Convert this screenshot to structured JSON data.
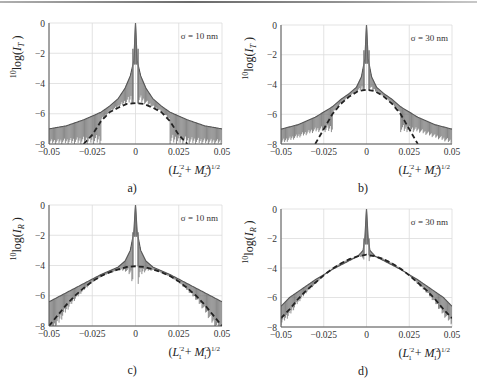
{
  "figure": {
    "top_rule_color": "#888888",
    "grid_color": "#dcdcdc",
    "axis_color": "#555555",
    "curve_color": "#555555",
    "dashed_color": "#222222"
  },
  "chart_data": [
    {
      "id": "a",
      "type": "line",
      "panel_label": "a)",
      "annotation": "σ = 10 nm",
      "ylabel": "10log(I_T)",
      "ylabel_parts": {
        "pre": "10",
        "main": "log(",
        "var": "I",
        "sub": "T",
        "post": " )"
      },
      "xlabel": "(L2'^2 + M2'^2)^1/2",
      "xlabel_parts": {
        "var1": "L",
        "sub1": "2",
        "sup1": "′2",
        "var2": "M",
        "sub2": "2",
        "sup2": "′2",
        "pow": "1/2"
      },
      "xlim": [
        -0.05,
        0.05
      ],
      "ylim": [
        -8,
        0
      ],
      "xticks": [
        "-0.05",
        "-0.025",
        "0",
        "0.025",
        "0.05"
      ],
      "yticks": [
        "0",
        "-2",
        "-4",
        "-6",
        "-8"
      ],
      "grid": true,
      "frame": {
        "x0": 49,
        "y0": 23,
        "x1": 222,
        "y1": 144
      },
      "series": [
        {
          "name": "envelope (oscillating, solid)",
          "x": [
            -0.05,
            -0.04,
            -0.03,
            -0.02,
            -0.015,
            -0.01,
            -0.006,
            -0.003,
            -0.001,
            0,
            0.001,
            0.003,
            0.006,
            0.01,
            0.015,
            0.02,
            0.03,
            0.04,
            0.05
          ],
          "values": [
            -7.0,
            -6.8,
            -6.4,
            -5.9,
            -5.5,
            -5.0,
            -4.3,
            -3.5,
            -2.5,
            0,
            -2.5,
            -3.5,
            -4.3,
            -5.0,
            -5.5,
            -5.9,
            -6.4,
            -6.8,
            -7.0
          ]
        },
        {
          "name": "oscillation floor",
          "x": [
            -0.05,
            0.05
          ],
          "values": [
            -8,
            -8
          ]
        },
        {
          "name": "mean (dashed)",
          "x": [
            -0.03,
            -0.025,
            -0.02,
            -0.015,
            -0.01,
            -0.005,
            0,
            0.005,
            0.01,
            0.015,
            0.02,
            0.025,
            0.03
          ],
          "values": [
            -8.0,
            -7.4,
            -6.5,
            -5.9,
            -5.6,
            -5.35,
            -5.3,
            -5.35,
            -5.6,
            -5.9,
            -6.5,
            -7.4,
            -8.0
          ]
        }
      ],
      "central_peak": {
        "x": 0,
        "y": 0,
        "side_peaks_y": -1.7
      }
    },
    {
      "id": "b",
      "type": "line",
      "panel_label": "b)",
      "annotation": "σ = 30 nm",
      "ylabel": "10log(I_T)",
      "ylabel_parts": {
        "pre": "10",
        "main": "log(",
        "var": "I",
        "sub": "T",
        "post": " )"
      },
      "xlabel": "(L2'^2 + M2'^2)^1/2",
      "xlabel_parts": {
        "var1": "L",
        "sub1": "2",
        "sup1": "′2",
        "var2": "M",
        "sub2": "2",
        "sup2": "′2",
        "pow": "1/2"
      },
      "xlim": [
        -0.05,
        0.05
      ],
      "ylim": [
        -8,
        0
      ],
      "xticks": [
        "-0.05",
        "-0.025",
        "0",
        "0.025",
        "0.05"
      ],
      "yticks": [
        "0",
        "-2",
        "-4",
        "-6",
        "-8"
      ],
      "grid": true,
      "frame": {
        "x0": 281,
        "y0": 25,
        "x1": 452,
        "y1": 144
      },
      "series": [
        {
          "name": "envelope (oscillating, solid)",
          "x": [
            -0.05,
            -0.04,
            -0.03,
            -0.02,
            -0.015,
            -0.01,
            -0.006,
            -0.003,
            -0.001,
            0,
            0.001,
            0.003,
            0.006,
            0.01,
            0.015,
            0.02,
            0.03,
            0.04,
            0.05
          ],
          "values": [
            -7.0,
            -6.7,
            -6.2,
            -5.5,
            -5.0,
            -4.6,
            -4.2,
            -3.5,
            -2.3,
            0,
            -2.3,
            -3.5,
            -4.2,
            -4.6,
            -5.0,
            -5.5,
            -6.2,
            -6.7,
            -7.0
          ]
        },
        {
          "name": "oscillation floor",
          "x": [
            -0.05,
            -0.03,
            0.03,
            0.05
          ],
          "values": [
            -8,
            -7.2,
            -7.2,
            -8
          ]
        },
        {
          "name": "mean (dashed)",
          "x": [
            -0.03,
            -0.025,
            -0.02,
            -0.015,
            -0.01,
            -0.005,
            0,
            0.005,
            0.01,
            0.015,
            0.02,
            0.025,
            0.03
          ],
          "values": [
            -8.0,
            -7.0,
            -6.0,
            -5.3,
            -4.8,
            -4.45,
            -4.35,
            -4.45,
            -4.8,
            -5.3,
            -6.0,
            -7.0,
            -8.0
          ]
        }
      ],
      "central_peak": {
        "x": 0,
        "y": 0,
        "side_peaks_y": -1.7
      }
    },
    {
      "id": "c",
      "type": "line",
      "panel_label": "c)",
      "annotation": "σ = 10 nm",
      "ylabel": "10log(I_R)",
      "ylabel_parts": {
        "pre": "10",
        "main": "log(",
        "var": "I",
        "sub": "R",
        "post": " )"
      },
      "xlabel": "(L1'^2 + M1'^2)^1/2",
      "xlabel_parts": {
        "var1": "L",
        "sub1": "1",
        "sup1": "′2",
        "var2": "M",
        "sub2": "1",
        "sup2": "′2",
        "pow": "1/2"
      },
      "xlim": [
        -0.05,
        0.05
      ],
      "ylim": [
        -8,
        0
      ],
      "xticks": [
        "-0.05",
        "-0.025",
        "0",
        "0.025",
        "0.05"
      ],
      "yticks": [
        "0",
        "-2",
        "-4",
        "-6",
        "-8"
      ],
      "grid": true,
      "frame": {
        "x0": 49,
        "y0": 205,
        "x1": 222,
        "y1": 326
      },
      "series": [
        {
          "name": "envelope (oscillating, solid)",
          "x": [
            -0.05,
            -0.04,
            -0.03,
            -0.02,
            -0.01,
            -0.006,
            -0.003,
            -0.001,
            0,
            0.001,
            0.003,
            0.006,
            0.01,
            0.02,
            0.03,
            0.04,
            0.05
          ],
          "values": [
            -6.4,
            -5.8,
            -5.2,
            -4.6,
            -4.1,
            -3.7,
            -3.0,
            -1.8,
            0,
            -1.8,
            -3.0,
            -3.7,
            -4.1,
            -4.6,
            -5.2,
            -5.8,
            -6.4
          ]
        },
        {
          "name": "mean (dashed)",
          "x": [
            -0.05,
            -0.045,
            -0.04,
            -0.035,
            -0.03,
            -0.025,
            -0.02,
            -0.015,
            -0.01,
            -0.005,
            0,
            0.005,
            0.01,
            0.015,
            0.02,
            0.025,
            0.03,
            0.035,
            0.04,
            0.045,
            0.05
          ],
          "values": [
            -8.0,
            -7.3,
            -6.6,
            -6.0,
            -5.5,
            -5.05,
            -4.7,
            -4.45,
            -4.25,
            -4.1,
            -4.05,
            -4.1,
            -4.25,
            -4.45,
            -4.7,
            -5.05,
            -5.5,
            -6.0,
            -6.6,
            -7.3,
            -8.0
          ]
        }
      ],
      "central_peak": {
        "x": 0,
        "y": 0,
        "side_peaks_y": -1.8
      }
    },
    {
      "id": "d",
      "type": "line",
      "panel_label": "d)",
      "annotation": "σ = 30 nm",
      "ylabel": "10log(I_R)",
      "ylabel_parts": {
        "pre": "10",
        "main": "log(",
        "var": "I",
        "sub": "R",
        "post": " )"
      },
      "xlabel": "(L1'^2 + M1'^2)^1/2",
      "xlabel_parts": {
        "var1": "L",
        "sub1": "1",
        "sup1": "′2",
        "var2": "M",
        "sub2": "1",
        "sup2": "′2",
        "pow": "1/2"
      },
      "xlim": [
        -0.05,
        0.05
      ],
      "ylim": [
        -8,
        0
      ],
      "xticks": [
        "-0.05",
        "-0.025",
        "0",
        "0.025",
        "0.05"
      ],
      "yticks": [
        "0",
        "-2",
        "-4",
        "-6",
        "-8"
      ],
      "grid": true,
      "frame": {
        "x0": 281,
        "y0": 209,
        "x1": 452,
        "y1": 327
      },
      "series": [
        {
          "name": "envelope (oscillating, solid)",
          "x": [
            -0.05,
            -0.045,
            -0.04,
            -0.03,
            -0.02,
            -0.01,
            -0.005,
            -0.002,
            -0.001,
            0,
            0.001,
            0.002,
            0.005,
            0.01,
            0.02,
            0.03,
            0.04,
            0.045,
            0.05
          ],
          "values": [
            -6.6,
            -6.0,
            -5.6,
            -4.8,
            -4.1,
            -3.5,
            -3.2,
            -2.8,
            -2.0,
            0,
            -2.0,
            -2.8,
            -3.2,
            -3.5,
            -4.1,
            -4.8,
            -5.6,
            -6.0,
            -6.6
          ]
        },
        {
          "name": "mean (dashed)",
          "x": [
            -0.05,
            -0.045,
            -0.04,
            -0.035,
            -0.03,
            -0.025,
            -0.02,
            -0.015,
            -0.01,
            -0.005,
            0,
            0.005,
            0.01,
            0.015,
            0.02,
            0.025,
            0.03,
            0.035,
            0.04,
            0.045,
            0.05
          ],
          "values": [
            -7.4,
            -6.8,
            -6.1,
            -5.5,
            -5.0,
            -4.5,
            -4.05,
            -3.7,
            -3.4,
            -3.2,
            -3.1,
            -3.2,
            -3.4,
            -3.7,
            -4.05,
            -4.5,
            -5.0,
            -5.5,
            -6.1,
            -6.8,
            -7.4
          ]
        }
      ],
      "central_peak": {
        "x": 0,
        "y": 0,
        "side_peaks_y": -2.0
      }
    }
  ]
}
